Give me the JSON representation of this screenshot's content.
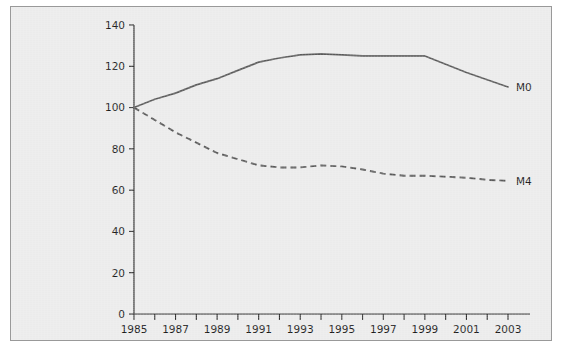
{
  "chart_data": {
    "type": "line",
    "title": "",
    "subtitle": "",
    "xlabel": "",
    "ylabel": "",
    "xlim": [
      1985,
      2003
    ],
    "ylim": [
      0,
      140
    ],
    "grid": false,
    "legend_position": "end-of-line",
    "y_ticks": [
      0,
      20,
      40,
      60,
      80,
      100,
      120,
      140
    ],
    "y_tick_labels": [
      "0",
      "20",
      "40",
      "60",
      "80",
      "100",
      "120",
      "140"
    ],
    "x_ticks": [
      1985,
      1986,
      1987,
      1988,
      1989,
      1990,
      1991,
      1992,
      1993,
      1994,
      1995,
      1996,
      1997,
      1998,
      1999,
      2000,
      2001,
      2002,
      2003
    ],
    "x_tick_labels": [
      "1985",
      "",
      "1987",
      "",
      "1989",
      "",
      "1991",
      "",
      "1993",
      "",
      "1995",
      "",
      "1997",
      "",
      "1999",
      "",
      "2001",
      "",
      "2003"
    ],
    "x": [
      1985,
      1986,
      1987,
      1988,
      1989,
      1990,
      1991,
      1992,
      1993,
      1994,
      1995,
      1996,
      1997,
      1998,
      1999,
      2000,
      2001,
      2002,
      2003
    ],
    "series": [
      {
        "name": "M0",
        "style": "solid",
        "color": "#5a5a5a",
        "label": "M0",
        "values": [
          100,
          104,
          107,
          111,
          114,
          118,
          122,
          124,
          125.5,
          126,
          125.5,
          125,
          125,
          125,
          125,
          121,
          117,
          113.5,
          110
        ]
      },
      {
        "name": "M4",
        "style": "dashed",
        "color": "#5a5a5a",
        "label": "M4",
        "values": [
          100,
          94,
          88,
          83,
          78,
          75,
          72,
          71,
          71,
          72,
          71.5,
          70,
          68,
          67,
          67,
          66.5,
          66,
          65,
          64.5
        ]
      }
    ]
  },
  "figure": {
    "background_color": "#ebebeb",
    "border_color": "#999999",
    "axis_color": "#2b2b2b"
  }
}
